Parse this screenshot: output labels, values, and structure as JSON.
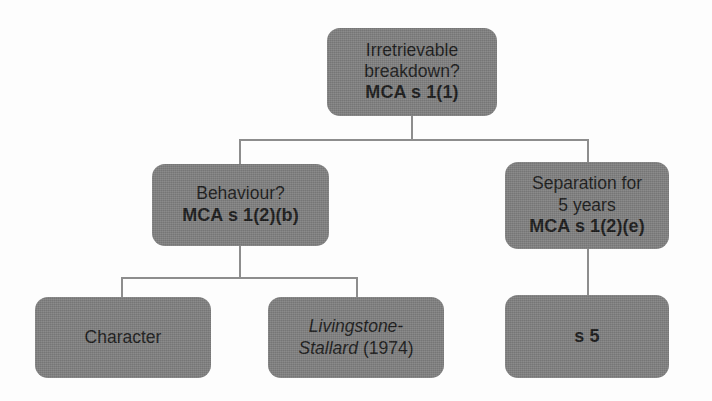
{
  "diagram": {
    "title_hidden": "",
    "colors": {
      "node_fill": "#808080",
      "connector": "#8d8d8d",
      "text": "#1b1b1b",
      "background": "#fdfdfd"
    },
    "nodes": {
      "root": {
        "line1": "Irretrievable",
        "line2": "breakdown?",
        "statute": "MCA s 1(1)"
      },
      "behaviour": {
        "line1": "Behaviour?",
        "statute": "MCA s 1(2)(b)"
      },
      "separation": {
        "line1": "Separation for",
        "line2": "5 years",
        "statute": "MCA s 1(2)(e)"
      },
      "character": {
        "line1": "Character"
      },
      "livingstone": {
        "case_italic_line1": "Livingstone-",
        "case_italic_line2": "Stallard",
        "case_year": "(1974)"
      },
      "s5": {
        "statute": "s 5"
      }
    }
  }
}
